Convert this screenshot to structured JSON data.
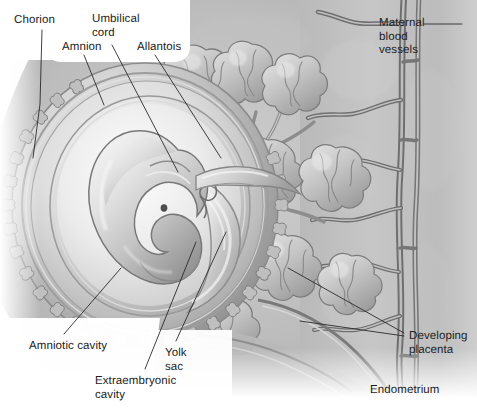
{
  "figure": {
    "width": 477,
    "height": 416,
    "background": "#ffffff",
    "style": "grayscale airbrushed medical illustration",
    "palette": {
      "paper": "#ffffff",
      "tissue_light": "#d9d9d9",
      "tissue_mid": "#b4b4b4",
      "tissue_dark": "#8a8a8a",
      "outline": "#5a5a5a",
      "vessel_dark": "#6f6f6f",
      "text": "#1d1d1d",
      "leader": "#2a2a2a"
    }
  },
  "labels": [
    {
      "id": "chorion",
      "text": "Chorion",
      "lines": [
        "Chorion"
      ],
      "x": 14,
      "y": 14,
      "align": "left"
    },
    {
      "id": "umbilical-cord",
      "text": "Umbilical cord",
      "lines": [
        "Umbilical",
        "cord"
      ],
      "x": 92,
      "y": 13,
      "align": "left"
    },
    {
      "id": "amnion",
      "text": "Amnion",
      "lines": [
        "Amnion"
      ],
      "x": 62,
      "y": 41,
      "align": "left"
    },
    {
      "id": "allantois",
      "text": "Allantois",
      "lines": [
        "Allantois"
      ],
      "x": 137,
      "y": 41,
      "align": "left"
    },
    {
      "id": "maternal-blood-vessels",
      "text": "Maternal blood vessels",
      "lines": [
        "Maternal",
        "blood",
        "vessels"
      ],
      "x": 379,
      "y": 17,
      "align": "left"
    },
    {
      "id": "developing-placenta",
      "text": "Developing placenta",
      "lines": [
        "Developing",
        "placenta"
      ],
      "x": 409,
      "y": 330,
      "align": "left"
    },
    {
      "id": "endometrium",
      "text": "Endometrium",
      "lines": [
        "Endometrium"
      ],
      "x": 370,
      "y": 384,
      "align": "left"
    },
    {
      "id": "amniotic-cavity",
      "text": "Amniotic cavity",
      "lines": [
        "Amniotic cavity"
      ],
      "x": 29,
      "y": 340,
      "align": "left"
    },
    {
      "id": "extraembryonic-cavity",
      "text": "Extraembryonic cavity",
      "lines": [
        "Extraembryonic",
        "cavity"
      ],
      "x": 95,
      "y": 375,
      "align": "left"
    },
    {
      "id": "yolk-sac",
      "text": "Yolk sac",
      "lines": [
        "Yolk",
        "sac"
      ],
      "x": 165,
      "y": 347,
      "align": "left"
    }
  ],
  "leaders": [
    {
      "id": "leader-chorion",
      "points": "42,30 40,104 33,158"
    },
    {
      "id": "leader-umbilical-cord",
      "points": "112,45 178,172"
    },
    {
      "id": "leader-amnion",
      "points": "84,55 104,105"
    },
    {
      "id": "leader-allantois",
      "points": "155,55 221,158"
    },
    {
      "id": "leader-maternal-blood-vessels",
      "points": "424,24 462,24"
    },
    {
      "id": "leader-placenta-upper",
      "points": "404,333 288,268"
    },
    {
      "id": "leader-placenta-lower",
      "points": "404,336 300,321"
    },
    {
      "id": "leader-amniotic-cavity",
      "points": "64,334 121,268"
    },
    {
      "id": "leader-extraembryonic-cavity",
      "points": "145,369 196,242"
    },
    {
      "id": "leader-yolk-sac",
      "points": "176,341 226,232"
    }
  ],
  "structures": [
    {
      "id": "chorion-shell",
      "name": "chorion"
    },
    {
      "id": "chorionic-villi-rim",
      "name": "chorionic villi rim"
    },
    {
      "id": "amnion-membrane",
      "name": "amnion"
    },
    {
      "id": "amniotic-cavity-space",
      "name": "amniotic cavity"
    },
    {
      "id": "embryo-body",
      "name": "embryo"
    },
    {
      "id": "embryo-eye",
      "name": "embryonic eye"
    },
    {
      "id": "yolk-sac-body",
      "name": "yolk sac"
    },
    {
      "id": "umbilical-cord-body",
      "name": "umbilical cord"
    },
    {
      "id": "allantois-body",
      "name": "allantois"
    },
    {
      "id": "villous-tree",
      "name": "branching chorionic villi"
    },
    {
      "id": "endometrium-wall",
      "name": "endometrium"
    },
    {
      "id": "maternal-vessels",
      "name": "maternal blood vessels"
    }
  ]
}
